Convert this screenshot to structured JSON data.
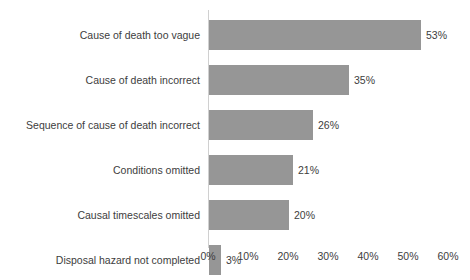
{
  "chart_data": {
    "type": "bar",
    "orientation": "horizontal",
    "title": "",
    "xlabel": "",
    "ylabel": "",
    "xlim": [
      0,
      60
    ],
    "grid": false,
    "legend": null,
    "bar_color": "#969696",
    "text_color": "#3d3d3d",
    "axis_color": "#d0d0d0",
    "categories": [
      "Cause of death too vague",
      "Cause of death incorrect",
      "Sequence of cause of death incorrect",
      "Conditions omitted",
      "Causal timescales omitted",
      "Disposal hazard not completed"
    ],
    "values": [
      53,
      35,
      26,
      21,
      20,
      3
    ],
    "value_labels": [
      "53%",
      "35%",
      "26%",
      "21%",
      "20%",
      "3%"
    ],
    "xticks": [
      0,
      10,
      20,
      30,
      40,
      50,
      60
    ],
    "xtick_labels": [
      "0%",
      "10%",
      "20%",
      "30%",
      "40%",
      "50%",
      "60%"
    ]
  },
  "geometry": {
    "origin_x": 208,
    "px_per_unit": 4.0,
    "row_top": 12,
    "row_pitch": 45,
    "axis_top": 10,
    "axis_height": 238,
    "xaxis_top": 250
  }
}
